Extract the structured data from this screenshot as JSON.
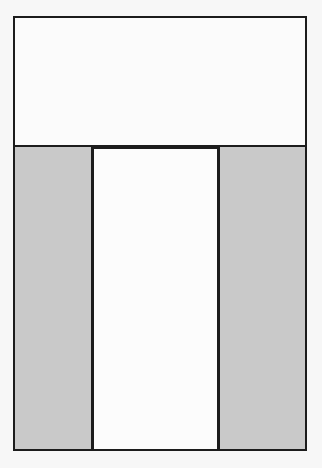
{
  "diagram": {
    "type": "layout-wireframe",
    "colors": {
      "background": "#f7f7f7",
      "panel_white": "#fbfbfb",
      "panel_gray": "#c9c9c9",
      "stroke": "#1c1c1c"
    },
    "regions": [
      {
        "id": "top-box",
        "fill": "white",
        "label": ""
      },
      {
        "id": "left-column",
        "fill": "gray",
        "label": ""
      },
      {
        "id": "center-column",
        "fill": "white",
        "label": ""
      },
      {
        "id": "right-column",
        "fill": "gray",
        "label": ""
      }
    ]
  }
}
